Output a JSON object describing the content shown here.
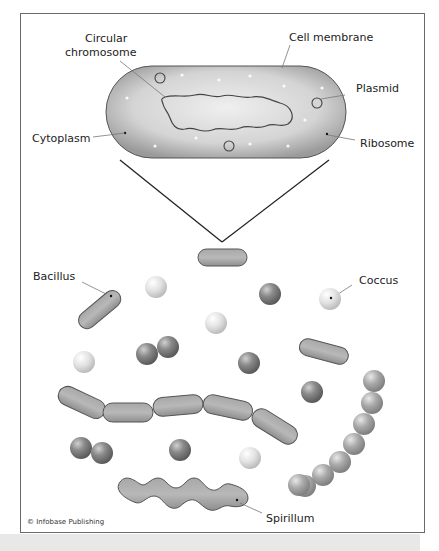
{
  "diagram": {
    "labels": {
      "circular_chromosome": [
        "Circular",
        "chromosome"
      ],
      "cell_membrane": "Cell membrane",
      "plasmid": "Plasmid",
      "cytoplasm": "Cytoplasm",
      "ribosome": "Ribosome",
      "bacillus": "Bacillus",
      "coccus": "Coccus",
      "spirillum": "Spirillum"
    },
    "copyright": "© Infobase Publishing",
    "caption_partial": "Bo..."
  },
  "colors": {
    "cell_fill": "#bdbdbd",
    "cell_stroke": "#555555",
    "coccus_dark": "#7a7a7a",
    "coccus_light": "#e0e0e0",
    "frame_border": "#6a6a6a"
  }
}
